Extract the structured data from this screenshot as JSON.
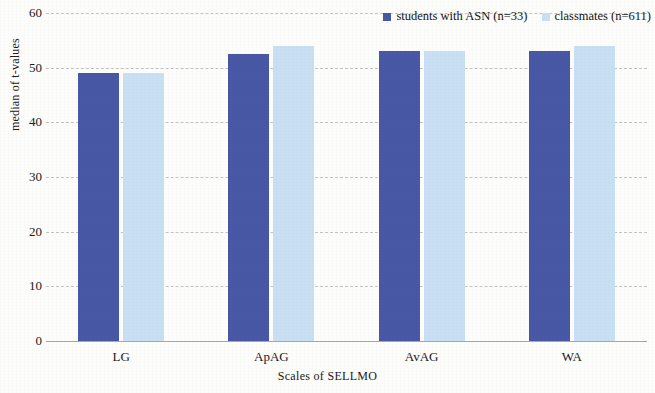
{
  "chart_data": {
    "type": "bar",
    "title": "",
    "xlabel": "Scales of SELLMO",
    "ylabel": "median of t-values",
    "categories": [
      "LG",
      "ApAG",
      "AvAG",
      "WA"
    ],
    "series": [
      {
        "name": "students with ASN (n=33)",
        "color": "#4858a5",
        "values": [
          49,
          52.5,
          53,
          53
        ]
      },
      {
        "name": "classmates (n=611)",
        "color": "#c9e0f4",
        "values": [
          49,
          54,
          53,
          54
        ]
      }
    ],
    "ylim": [
      0,
      60
    ],
    "yticks": [
      "0",
      "10",
      "20",
      "30",
      "40",
      "50",
      "60"
    ],
    "ytick_values": [
      0,
      10,
      20,
      30,
      40,
      50,
      60
    ],
    "grid": "horizontal-dashed",
    "legend_position": "top-right"
  },
  "legend": {
    "entries": [
      {
        "label": "students with ASN (n=33)",
        "swatch": "#4858a5"
      },
      {
        "label": "classmates (n=611)",
        "swatch": "#c9e0f4"
      }
    ]
  },
  "axes": {
    "y_label": "median of t-values",
    "x_label": "Scales of SELLMO"
  }
}
